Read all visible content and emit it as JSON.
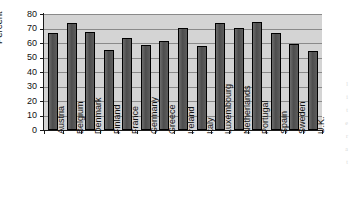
{
  "chart_data": {
    "type": "bar",
    "title": "",
    "xlabel": "",
    "ylabel": "Percent",
    "ylim": [
      0,
      80
    ],
    "ytick_step": 10,
    "grid": true,
    "legend": "none",
    "categories": [
      "Austria",
      "Belgium",
      "Denmark",
      "Finland",
      "France",
      "Germany",
      "Greece",
      "Ireland",
      "Italy",
      "Luxembourg",
      "Netherlands",
      "Portugal",
      "Spain",
      "Sweden",
      "U.K."
    ],
    "values": [
      67,
      74,
      67.5,
      55.5,
      63.5,
      58.5,
      61.5,
      70.5,
      58,
      73.5,
      70.5,
      74.5,
      67,
      59.5,
      54.5
    ],
    "ytick_labels": [
      "0",
      "10",
      "20",
      "30",
      "40",
      "50",
      "60",
      "70",
      "80"
    ],
    "ytick_values": [
      0,
      10,
      20,
      30,
      40,
      50,
      60,
      70,
      80
    ],
    "colors": {
      "bar_fill": "#565656",
      "bar_edge": "#000000",
      "plot_background": "#d4d4d4",
      "gridline": "#8a8a8a",
      "axis": "#1a1a1a",
      "text": "#111111",
      "page_background": "#ffffff"
    }
  },
  "artifacts": {
    "margin_marks": [
      "l",
      "i",
      "t",
      "e",
      "r",
      "a",
      "t"
    ]
  }
}
